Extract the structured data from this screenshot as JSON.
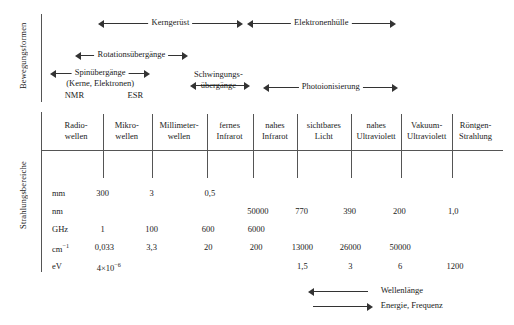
{
  "sections": {
    "motion_label": "Bewegungsformen",
    "radiation_label": "Strahlungsbereiche"
  },
  "motion_arrows": [
    {
      "label": "Kerngerüst",
      "left": 107,
      "right": 277,
      "top": 18,
      "heads": "both"
    },
    {
      "label": "Elektronenhülle",
      "left": 281,
      "right": 455,
      "top": 18,
      "heads": "both"
    },
    {
      "label": "Rotationsübergänge",
      "left": 81,
      "right": 212,
      "top": 50,
      "heads": "both"
    },
    {
      "label": "Spinübergänge",
      "left": 52,
      "right": 168,
      "top": 68,
      "heads": "both"
    },
    {
      "label": "Photoionisierung",
      "left": 300,
      "right": 458,
      "top": 82,
      "heads": "both"
    }
  ],
  "motion_texts": [
    {
      "text": "(Kerne, Elektronen)",
      "cx": 110,
      "top": 79
    },
    {
      "text": "NMR",
      "cx": 80,
      "top": 91
    },
    {
      "text": "ESR",
      "cx": 151,
      "top": 91
    },
    {
      "text": "Schwingungs-",
      "cx": 248,
      "top": 70
    },
    {
      "text": "übergänge",
      "cx": 248,
      "top": 81
    }
  ],
  "schwingung_arrow": {
    "left": 215,
    "right": 285,
    "top": 80,
    "heads": "both"
  },
  "bands": [
    {
      "lines": [
        "Radio-",
        "wellen"
      ],
      "cx": 82,
      "x0": 51,
      "x1": 113
    },
    {
      "lines": [
        "Mikro-",
        "wellen"
      ],
      "cx": 141,
      "x0": 113,
      "x1": 170
    },
    {
      "lines": [
        "Millimeter-",
        "wellen"
      ],
      "cx": 202,
      "x0": 170,
      "x1": 235
    },
    {
      "lines": [
        "fernes",
        "Infrarot"
      ],
      "cx": 261,
      "x0": 235,
      "x1": 288
    },
    {
      "lines": [
        "nahes",
        "Infrarot"
      ],
      "cx": 314,
      "x0": 288,
      "x1": 340
    },
    {
      "lines": [
        "sichtbares",
        "Licht"
      ],
      "cx": 371,
      "x0": 340,
      "x1": 403
    },
    {
      "lines": [
        "nahes",
        "Ultraviolett"
      ],
      "cx": 432,
      "x0": 403,
      "x1": 461
    },
    {
      "lines": [
        "Vakuum-",
        "Ultraviolett"
      ],
      "cx": 491,
      "x0": 461,
      "x1": 521
    },
    {
      "lines": [
        "Röntgen-",
        "Strahlung"
      ],
      "cx": 548,
      "x0": 521,
      "x1": 580
    }
  ],
  "boundaries": [
    113,
    170,
    235,
    288,
    340,
    403,
    461,
    521
  ],
  "rows": [
    {
      "unit": "mm",
      "unit_html": "mm",
      "top": 188,
      "values": [
        {
          "v": "300",
          "cx": 113
        },
        {
          "v": "3",
          "cx": 170
        },
        {
          "v": "0,5",
          "cx": 238
        }
      ]
    },
    {
      "unit": "nm",
      "unit_html": "nm",
      "top": 206,
      "values": [
        {
          "v": "50000",
          "cx": 294
        },
        {
          "v": "770",
          "cx": 345
        },
        {
          "v": "390",
          "cx": 401
        },
        {
          "v": "200",
          "cx": 459
        },
        {
          "v": "1,0",
          "cx": 522
        }
      ]
    },
    {
      "unit": "GHz",
      "unit_html": "GHz",
      "top": 224,
      "values": [
        {
          "v": "1",
          "cx": 113
        },
        {
          "v": "100",
          "cx": 170
        },
        {
          "v": "600",
          "cx": 236
        },
        {
          "v": "6000",
          "cx": 292
        }
      ]
    },
    {
      "unit": "cm-1",
      "unit_html": "cm<sup>&#8722;1</sup>",
      "top": 242,
      "values": [
        {
          "v": "0,033",
          "cx": 115
        },
        {
          "v": "3,3",
          "cx": 170
        },
        {
          "v": "20",
          "cx": 236
        },
        {
          "v": "200",
          "cx": 292
        },
        {
          "v": "13000",
          "cx": 346
        },
        {
          "v": "26000",
          "cx": 402
        },
        {
          "v": "50000",
          "cx": 460
        }
      ]
    },
    {
      "unit": "eV",
      "unit_html": "eV",
      "top": 261,
      "values_html": [
        {
          "v": "4&#215;10<sup>&#8722;6</sup>",
          "cx": 120
        },
        {
          "v": "1,5",
          "cx": 346
        },
        {
          "v": "3",
          "cx": 402
        },
        {
          "v": "6",
          "cx": 460
        },
        {
          "v": "1200",
          "cx": 524
        }
      ]
    }
  ],
  "legend": [
    {
      "label": "Wellenlänge",
      "direction": "left",
      "top": 286
    },
    {
      "label": "Energie, Frequenz",
      "direction": "right",
      "top": 301
    }
  ],
  "legend_arrow": {
    "left": 352,
    "right": 428
  },
  "colors": {
    "ink": "#1a1a1a",
    "rule": "#555555",
    "arrow": "#333333",
    "background": "#ffffff"
  }
}
